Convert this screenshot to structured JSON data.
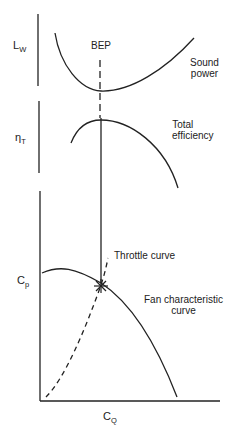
{
  "diagram": {
    "axes": {
      "sound_power": {
        "symbol": "L",
        "subscript": "W"
      },
      "efficiency": {
        "symbol": "η",
        "subscript": "T"
      },
      "pressure": {
        "symbol": "C",
        "subscript": "p"
      },
      "flow": {
        "symbol": "C",
        "subscript": "Q"
      }
    },
    "labels": {
      "bep": "BEP",
      "sound_power_line1": "Sound",
      "sound_power_line2": "power",
      "efficiency_line1": "Total",
      "efficiency_line2": "efficiency",
      "throttle": "Throttle curve",
      "fan_char_line1": "Fan characteristic",
      "fan_char_line2": "curve"
    },
    "curves": [
      {
        "name": "Sound power",
        "shape": "U-shaped, minimum at BEP"
      },
      {
        "name": "Total efficiency",
        "shape": "inverted parabola, maximum at BEP"
      },
      {
        "name": "Fan characteristic curve",
        "shape": "descending parabola"
      },
      {
        "name": "Throttle curve",
        "shape": "dashed parabola from origin through operating point"
      }
    ],
    "operating_point_marker": "asterisk at intersection of throttle and fan curves",
    "colors": {
      "line": "#222222",
      "background": "#ffffff"
    }
  }
}
